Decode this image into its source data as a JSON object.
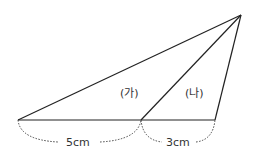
{
  "diagram": {
    "regions": [
      {
        "id": "ga",
        "label": "(가)"
      },
      {
        "id": "na",
        "label": "(나)"
      }
    ],
    "measurements": [
      {
        "segment": "left-base",
        "label": "5cm"
      },
      {
        "segment": "right-base",
        "label": "3cm"
      }
    ],
    "colors": {
      "line": "#222222",
      "dotted": "#444444",
      "text": "#333333"
    }
  }
}
